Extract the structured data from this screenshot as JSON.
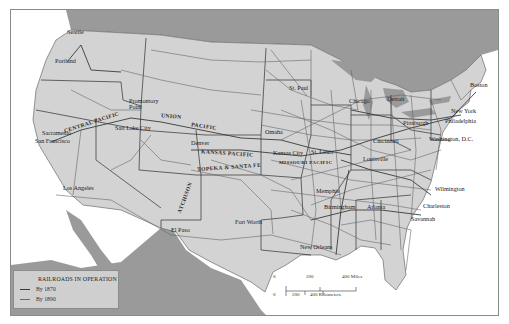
{
  "map": {
    "title": "Railroads in Operation, United States",
    "colors": {
      "land": "#d3d3d3",
      "water_foreign": "#9a9a9a",
      "ocean": "#ffffff",
      "rail_1870": "#3a3a3a",
      "rail_1890": "#6a6a6a",
      "border": "#2e2e2e"
    },
    "cities": [
      {
        "name": "Seattle",
        "x": 66,
        "y": 33
      },
      {
        "name": "Portland",
        "x": 54,
        "y": 61
      },
      {
        "name": "Promontory Point",
        "x": 128,
        "y": 101
      },
      {
        "name": "Sacramento",
        "x": 41,
        "y": 131
      },
      {
        "name": "San Francisco",
        "x": 33,
        "y": 140
      },
      {
        "name": "Salt Lake City",
        "x": 131,
        "y": 125
      },
      {
        "name": "Denver",
        "x": 190,
        "y": 142
      },
      {
        "name": "Los Angeles",
        "x": 62,
        "y": 186
      },
      {
        "name": "El Paso",
        "x": 168,
        "y": 229
      },
      {
        "name": "Fort Worth",
        "x": 262,
        "y": 224
      },
      {
        "name": "New Orleans",
        "x": 327,
        "y": 245
      },
      {
        "name": "St. Paul",
        "x": 296,
        "y": 86
      },
      {
        "name": "Chicago",
        "x": 347,
        "y": 100
      },
      {
        "name": "Detroit",
        "x": 386,
        "y": 95
      },
      {
        "name": "Kansas City",
        "x": 298,
        "y": 146
      },
      {
        "name": "St. Louis",
        "x": 342,
        "y": 148
      },
      {
        "name": "Omaha",
        "x": 276,
        "y": 127
      },
      {
        "name": "Cincinnati",
        "x": 376,
        "y": 140
      },
      {
        "name": "Louisville",
        "x": 370,
        "y": 152
      },
      {
        "name": "Pittsburgh",
        "x": 410,
        "y": 118
      },
      {
        "name": "Memphis",
        "x": 320,
        "y": 187
      },
      {
        "name": "Birmingham",
        "x": 348,
        "y": 203
      },
      {
        "name": "Atlanta",
        "x": 372,
        "y": 202
      },
      {
        "name": "Boston",
        "x": 467,
        "y": 81
      },
      {
        "name": "New York",
        "x": 447,
        "y": 108
      },
      {
        "name": "Philadelphia",
        "x": 440,
        "y": 118
      },
      {
        "name": "Washington, D.C.",
        "x": 430,
        "y": 135
      },
      {
        "name": "Wilmington",
        "x": 428,
        "y": 185
      },
      {
        "name": "Charleston",
        "x": 416,
        "y": 204
      },
      {
        "name": "Savannah",
        "x": 405,
        "y": 217
      }
    ],
    "railroad_labels": [
      {
        "name": "CENTRAL PACIFIC",
        "x": 62,
        "y": 110,
        "rotate": -18
      },
      {
        "name": "UNION",
        "x": 160,
        "y": 115,
        "rotate": 4
      },
      {
        "name": "PACIFIC",
        "x": 190,
        "y": 123,
        "rotate": 8
      },
      {
        "name": "KANSAS PACIFIC",
        "x": 200,
        "y": 143,
        "rotate": 4
      },
      {
        "name": "TOPEKA & SANTA FE",
        "x": 198,
        "y": 161,
        "rotate": -4
      },
      {
        "name": "ATCHISON",
        "x": 176,
        "y": 183,
        "rotate": -70
      },
      {
        "name": "MISSOURI PACIFIC",
        "x": 278,
        "y": 152,
        "rotate": 0
      }
    ],
    "legend": {
      "title": "RAILROADS IN OPERATION",
      "items": [
        {
          "label": "By 1870",
          "color": "#3a3a3a"
        },
        {
          "label": "By 1890",
          "color": "#6a6a6a"
        }
      ]
    },
    "scale_bar": {
      "miles": [
        "0",
        "200",
        "400 Miles"
      ],
      "kilometers": [
        "0",
        "200",
        "400 Kilometers"
      ]
    }
  }
}
